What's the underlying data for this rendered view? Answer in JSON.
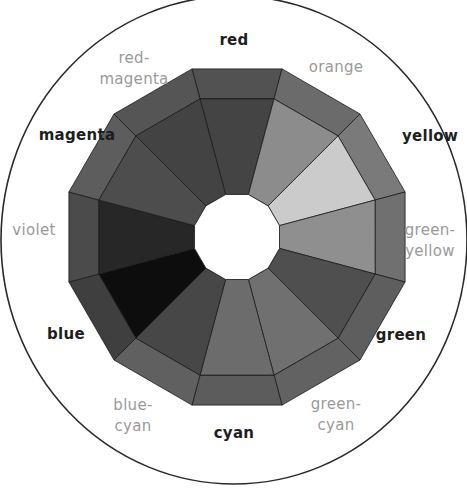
{
  "diagram": {
    "center": [
      237,
      237
    ],
    "outer_circle": {
      "cx": 234,
      "cy": 240,
      "rx": 233,
      "ry": 244,
      "stroke": "#2a2a2a"
    },
    "outer_radius": 174,
    "ring_radius": 143,
    "hole_radius": 44,
    "edge_color": "#1a1a1a",
    "hole_color": "#ffffff",
    "segments": [
      {
        "name": "red",
        "angle": -90,
        "outer": "#525252",
        "inner": "#444444"
      },
      {
        "name": "orange",
        "angle": -60,
        "outer": "#6b6b6b",
        "inner": "#8c8c8c"
      },
      {
        "name": "yellow",
        "angle": -30,
        "outer": "#7a7a7a",
        "inner": "#cbcbcb"
      },
      {
        "name": "green-yellow",
        "angle": 0,
        "outer": "#707070",
        "inner": "#8f8f8f"
      },
      {
        "name": "green",
        "angle": 30,
        "outer": "#5e5e5e",
        "inner": "#4f4f4f"
      },
      {
        "name": "green-cyan",
        "angle": 60,
        "outer": "#626262",
        "inner": "#707070"
      },
      {
        "name": "cyan",
        "angle": 90,
        "outer": "#5c5c5c",
        "inner": "#6c6c6c"
      },
      {
        "name": "blue-cyan",
        "angle": 120,
        "outer": "#606060",
        "inner": "#474747"
      },
      {
        "name": "blue",
        "angle": 150,
        "outer": "#3f3f3f",
        "inner": "#0d0d0d"
      },
      {
        "name": "violet",
        "angle": 180,
        "outer": "#4b4b4b",
        "inner": "#272727"
      },
      {
        "name": "magenta",
        "angle": 210,
        "outer": "#5d5d5d",
        "inner": "#4d4d4d"
      },
      {
        "name": "red-magenta",
        "angle": 240,
        "outer": "#555555",
        "inner": "#434343"
      }
    ]
  },
  "labels": [
    {
      "id": "red",
      "lines": [
        "red"
      ],
      "type": "primary",
      "x": 234,
      "y": 40
    },
    {
      "id": "red-magenta",
      "lines": [
        "red-",
        "magenta"
      ],
      "type": "secondary",
      "x": 134,
      "y": 69
    },
    {
      "id": "orange",
      "lines": [
        "orange"
      ],
      "type": "secondary",
      "x": 336,
      "y": 67
    },
    {
      "id": "magenta",
      "lines": [
        "magenta"
      ],
      "type": "primary",
      "x": 77,
      "y": 135
    },
    {
      "id": "yellow",
      "lines": [
        "yellow"
      ],
      "type": "primary",
      "x": 430,
      "y": 136
    },
    {
      "id": "violet",
      "lines": [
        "violet"
      ],
      "type": "secondary",
      "x": 34,
      "y": 230
    },
    {
      "id": "green-yellow",
      "lines": [
        "green-",
        "yellow"
      ],
      "type": "secondary",
      "x": 430,
      "y": 241
    },
    {
      "id": "blue",
      "lines": [
        "blue"
      ],
      "type": "primary",
      "x": 66,
      "y": 334
    },
    {
      "id": "green",
      "lines": [
        "green"
      ],
      "type": "primary",
      "x": 401,
      "y": 335
    },
    {
      "id": "blue-cyan",
      "lines": [
        "blue-",
        "cyan"
      ],
      "type": "secondary",
      "x": 133,
      "y": 416
    },
    {
      "id": "cyan",
      "lines": [
        "cyan"
      ],
      "type": "primary",
      "x": 234,
      "y": 433
    },
    {
      "id": "green-cyan",
      "lines": [
        "green-",
        "cyan"
      ],
      "type": "secondary",
      "x": 336,
      "y": 415
    }
  ]
}
